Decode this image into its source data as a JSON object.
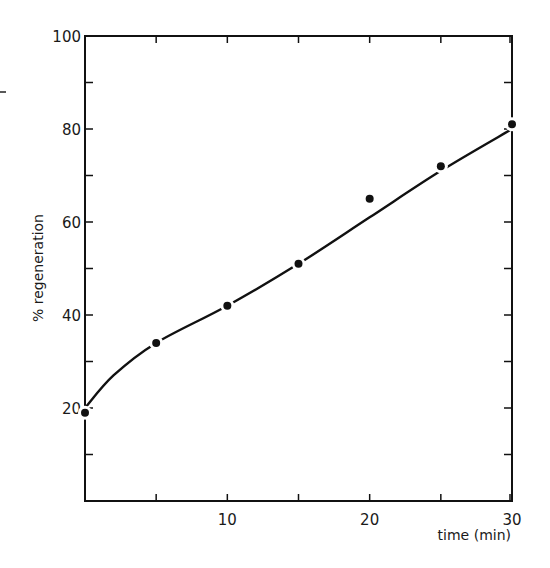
{
  "chart_data": {
    "type": "scatter",
    "title": "",
    "xlabel": "time (min)",
    "ylabel": "% regeneration",
    "xlim": [
      0,
      30
    ],
    "ylim": [
      0,
      100
    ],
    "x_ticks": [
      5,
      10,
      15,
      20,
      25,
      30
    ],
    "x_tick_labels": [
      "10",
      "20",
      "30"
    ],
    "x_tick_label_values": [
      10,
      20,
      30
    ],
    "y_ticks": [
      10,
      20,
      30,
      40,
      50,
      60,
      70,
      80,
      90,
      100
    ],
    "y_tick_labels": [
      "20",
      "40",
      "60",
      "80",
      "100"
    ],
    "y_tick_label_values": [
      20,
      40,
      60,
      80,
      100
    ],
    "grid": false,
    "legend": null,
    "series": [
      {
        "name": "measured",
        "marker": "filled-circle",
        "x": [
          0,
          5,
          10,
          15,
          20,
          25,
          30
        ],
        "y": [
          19,
          34,
          42,
          51,
          65,
          72,
          81
        ]
      },
      {
        "name": "fitted curve",
        "style": "solid-line",
        "x": [
          0,
          2,
          5,
          10,
          15,
          20,
          25,
          30
        ],
        "y": [
          20,
          27,
          34,
          42,
          51,
          61,
          71,
          80
        ]
      }
    ],
    "colors": {
      "ink": "#111111",
      "background": "#ffffff"
    }
  }
}
